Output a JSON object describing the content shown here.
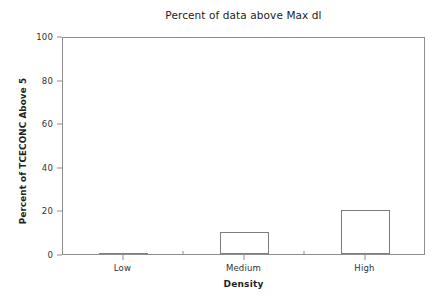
{
  "chart_data": {
    "type": "bar",
    "title": "Percent of data above Max dl",
    "xlabel": "Density",
    "ylabel": "Percent of TCECONC Above 5",
    "categories": [
      "Low",
      "Medium",
      "High"
    ],
    "values": [
      0,
      10,
      20
    ],
    "ylim": [
      0,
      100
    ],
    "yticks": [
      0,
      20,
      40,
      60,
      80,
      100
    ],
    "ytick_labels": [
      "0",
      "20",
      "40",
      "60",
      "80",
      "100"
    ],
    "grid": false,
    "legend": null,
    "bar_style": {
      "fill": "none",
      "edge_color": "#7d7d7d",
      "edge_width": 1
    },
    "frame_color": "#8e8e8e",
    "background": "#ffffff",
    "text_color": "#232323"
  }
}
